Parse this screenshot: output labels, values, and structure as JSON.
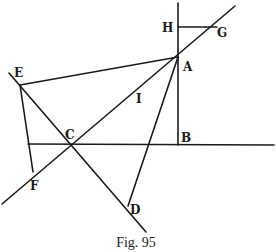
{
  "figure": {
    "caption": "Fig. 95",
    "stroke_color": "#1a1a1a",
    "background": "#ffffff"
  },
  "points": {
    "A": {
      "label": "A",
      "x": 178,
      "y": 57
    },
    "B": {
      "label": "B",
      "x": 178,
      "y": 145
    },
    "C": {
      "label": "C",
      "x": 71,
      "y": 144
    },
    "D": {
      "label": "D",
      "x": 128,
      "y": 206
    },
    "E": {
      "label": "E",
      "x": 20,
      "y": 85
    },
    "F": {
      "label": "F",
      "x": 33,
      "y": 172
    },
    "G": {
      "label": "G",
      "x": 216,
      "y": 27
    },
    "H": {
      "label": "H",
      "x": 178,
      "y": 27
    },
    "I": {
      "label": "I",
      "x": 140,
      "y": 99
    }
  },
  "segments": [
    {
      "name": "vertical-line-HB",
      "from": "H",
      "to": "B"
    },
    {
      "name": "segment-HG",
      "from": "H",
      "to": "G"
    },
    {
      "name": "line-FCA-G",
      "from": "F",
      "to": "G"
    },
    {
      "name": "segment-EA",
      "from": "E",
      "to": "A"
    },
    {
      "name": "line-ECD",
      "from": "E",
      "to": "D"
    },
    {
      "name": "segment-EF",
      "from": "E",
      "to": "F"
    },
    {
      "name": "segment-AD",
      "from": "A",
      "to": "D"
    },
    {
      "name": "horizontal-line-CB",
      "from": "C",
      "to": "B"
    }
  ]
}
